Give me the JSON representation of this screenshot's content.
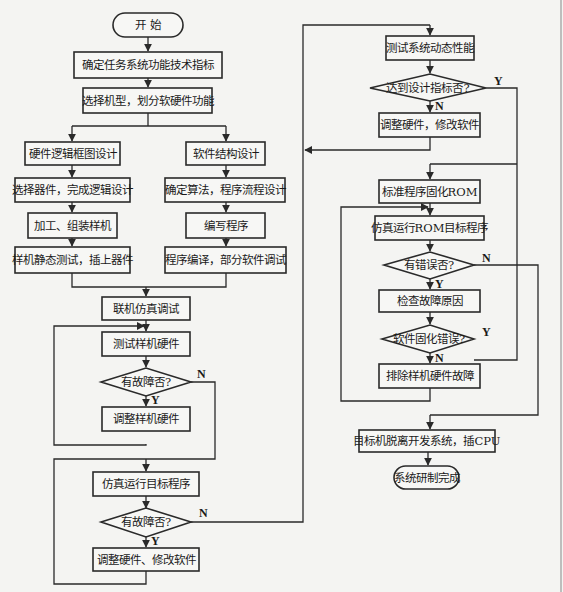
{
  "diagram": {
    "type": "flowchart",
    "nodes": {
      "start": "开 始",
      "define_specs": "确定任务系统功能技术指标",
      "select_model": "选择机型，划分软硬件功能",
      "hw_block": "硬件逻辑框图设计",
      "hw_select": "选择器件，完成逻辑设计",
      "hw_build": "加工、组装样机",
      "hw_static": "样机静态测试，插上器件",
      "sw_struct": "软件结构设计",
      "sw_algo": "确定算法，程序流程设计",
      "sw_write": "编写程序",
      "sw_compile": "程序编译，部分软件调试",
      "joint_sim": "联机仿真调试",
      "test_hw": "测试样机硬件",
      "dec_fault1": "有故障否?",
      "adjust_hw": "调整样机硬件",
      "run_target": "仿真运行目标程序",
      "dec_fault2": "有故障否?",
      "adjust_hw_sw": "调整硬件、修改软件",
      "test_dynamic": "测试系统动态性能",
      "dec_spec": "达到设计指标否?",
      "adjust_hw_sw2": "调整硬件，修改软件",
      "burn_rom": "标准程序固化ROM",
      "run_rom": "仿真运行ROM目标程序",
      "dec_error": "有错误否?",
      "check_cause": "检查故障原因",
      "dec_burn_error": "软件固化错误?",
      "fix_hw": "排除样机硬件故障",
      "detach": "目标机脱离开发系统，插CPU",
      "done": "系统研制完成"
    },
    "labels": {
      "yes": "Y",
      "no": "N"
    }
  }
}
